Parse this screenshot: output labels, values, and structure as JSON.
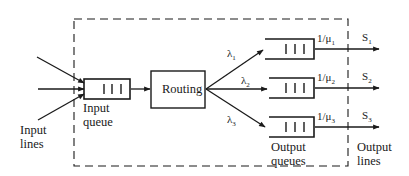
{
  "diagram": {
    "type": "queueing-network",
    "colors": {
      "stroke": "#1a1a1a",
      "background": "#ffffff"
    },
    "input_lines_label": "Input\nlines",
    "input_queue_label": "Input\nqueue",
    "routing_label": "Routing",
    "output_queues_label": "Output\nqueues",
    "output_lines_label": "Output\nlines",
    "arrival_rates": [
      {
        "symbol": "λ",
        "sub": "1"
      },
      {
        "symbol": "λ",
        "sub": "2"
      },
      {
        "symbol": "λ",
        "sub": "3"
      }
    ],
    "service_rates": [
      {
        "prefix": "1/μ",
        "sub": "1"
      },
      {
        "prefix": "1/μ",
        "sub": "2"
      },
      {
        "prefix": "1/μ",
        "sub": "3"
      }
    ],
    "servers": [
      {
        "symbol": "S",
        "sub": "1"
      },
      {
        "symbol": "S",
        "sub": "2"
      },
      {
        "symbol": "S",
        "sub": "3"
      }
    ]
  }
}
